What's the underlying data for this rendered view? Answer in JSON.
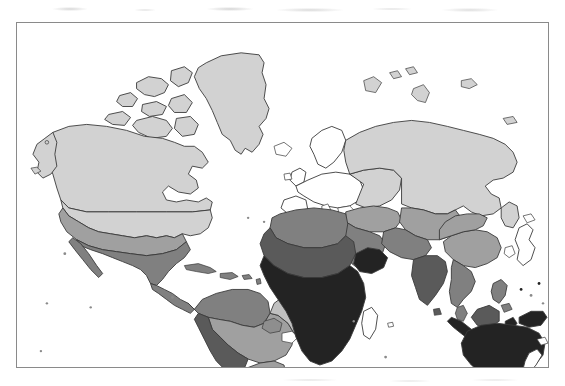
{
  "figure": {
    "type": "world-choropleth-map",
    "title": "",
    "caption": "",
    "projection": "equirectangular",
    "frame": {
      "x": 16,
      "y": 22,
      "width": 533,
      "height": 346,
      "border_color": "#8a8a8a"
    },
    "background_color": "#ffffff"
  },
  "legend": {
    "visible": false,
    "classes": [
      {
        "key": "none",
        "label": "",
        "color": "#ffffff"
      },
      {
        "key": "low",
        "label": "",
        "color": "#d2d2d2"
      },
      {
        "key": "low_mid",
        "label": "",
        "color": "#c0c0c0"
      },
      {
        "key": "mid",
        "label": "",
        "color": "#a0a0a0"
      },
      {
        "key": "mid_high",
        "label": "",
        "color": "#808080"
      },
      {
        "key": "high",
        "label": "",
        "color": "#5a5a5a"
      },
      {
        "key": "very_high",
        "label": "",
        "color": "#232323"
      }
    ]
  },
  "chart_data": {
    "type": "map",
    "title": "",
    "xlabel": "",
    "ylabel": "",
    "grid": false,
    "legend_position": "none",
    "value_scale": "ordinal shading, light = low value, dark = high value",
    "regions": [
      {
        "name": "Greenland",
        "class": "low",
        "color": "#d2d2d2"
      },
      {
        "name": "Canada",
        "class": "low",
        "color": "#d2d2d2"
      },
      {
        "name": "Alaska",
        "class": "low",
        "color": "#d2d2d2"
      },
      {
        "name": "United States",
        "class": "low",
        "color": "#d2d2d2"
      },
      {
        "name": "US Southwest band",
        "class": "mid",
        "color": "#a0a0a0"
      },
      {
        "name": "Mexico",
        "class": "mid_high",
        "color": "#808080"
      },
      {
        "name": "Central America",
        "class": "mid_high",
        "color": "#808080"
      },
      {
        "name": "Caribbean",
        "class": "mid_high",
        "color": "#808080"
      },
      {
        "name": "Colombia / Venezuela",
        "class": "mid_high",
        "color": "#808080"
      },
      {
        "name": "Andes / Peru / Bolivia",
        "class": "high",
        "color": "#5a5a5a"
      },
      {
        "name": "Amazon Basin",
        "class": "mid",
        "color": "#a0a0a0"
      },
      {
        "name": "Eastern Brazil",
        "class": "low_mid",
        "color": "#c0c0c0"
      },
      {
        "name": "Argentina",
        "class": "mid",
        "color": "#a0a0a0"
      },
      {
        "name": "Southern Cone",
        "class": "low_mid",
        "color": "#c0c0c0"
      },
      {
        "name": "Western Europe",
        "class": "none",
        "color": "#ffffff"
      },
      {
        "name": "Scandinavia",
        "class": "none",
        "color": "#ffffff"
      },
      {
        "name": "Eastern Europe",
        "class": "low",
        "color": "#d2d2d2"
      },
      {
        "name": "Russia",
        "class": "low",
        "color": "#d2d2d2"
      },
      {
        "name": "Central Asia",
        "class": "mid",
        "color": "#a0a0a0"
      },
      {
        "name": "Turkey / Caucasus",
        "class": "mid",
        "color": "#a0a0a0"
      },
      {
        "name": "North Africa / Sahara",
        "class": "mid_high",
        "color": "#808080"
      },
      {
        "name": "Sahel",
        "class": "high",
        "color": "#5a5a5a"
      },
      {
        "name": "Sub-Saharan Africa",
        "class": "very_high",
        "color": "#232323"
      },
      {
        "name": "Horn of Africa",
        "class": "very_high",
        "color": "#232323"
      },
      {
        "name": "Southern Africa",
        "class": "very_high",
        "color": "#232323"
      },
      {
        "name": "Madagascar",
        "class": "none",
        "color": "#ffffff"
      },
      {
        "name": "Arabian Peninsula",
        "class": "mid_high",
        "color": "#808080"
      },
      {
        "name": "Iran / Afghanistan",
        "class": "mid_high",
        "color": "#808080"
      },
      {
        "name": "India",
        "class": "high",
        "color": "#5a5a5a"
      },
      {
        "name": "China",
        "class": "mid",
        "color": "#a0a0a0"
      },
      {
        "name": "Southeast Asia",
        "class": "mid_high",
        "color": "#808080"
      },
      {
        "name": "Japan",
        "class": "none",
        "color": "#ffffff"
      },
      {
        "name": "Korea",
        "class": "none",
        "color": "#ffffff"
      },
      {
        "name": "Philippines",
        "class": "mid_high",
        "color": "#808080"
      },
      {
        "name": "Indonesia",
        "class": "very_high",
        "color": "#232323"
      },
      {
        "name": "Papua New Guinea",
        "class": "very_high",
        "color": "#232323"
      },
      {
        "name": "Australia",
        "class": "very_high",
        "color": "#232323"
      },
      {
        "name": "New Zealand",
        "class": "none",
        "color": "#ffffff"
      }
    ]
  }
}
